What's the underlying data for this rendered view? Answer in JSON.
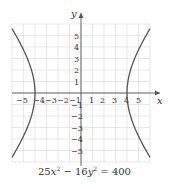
{
  "chart_data": {
    "type": "line",
    "equation": {
      "a": 25,
      "b": 16,
      "c": 400
    },
    "xlabel": "x",
    "ylabel": "y",
    "xlim": [
      -6,
      6
    ],
    "ylim": [
      -6,
      6
    ],
    "grid": true,
    "x_ticks": [
      -5,
      -4,
      -3,
      -2,
      -1,
      1,
      2,
      3,
      4,
      5
    ],
    "y_ticks": [
      5,
      4,
      3,
      2,
      1,
      -1,
      -2,
      -3,
      -4,
      -5
    ],
    "vertices": [
      [
        -4,
        0
      ],
      [
        4,
        0
      ]
    ],
    "series": [
      {
        "name": "right branch",
        "x": [
          6,
          5,
          4.5,
          4.2,
          4,
          4.2,
          4.5,
          5,
          6
        ],
        "y": [
          5.59,
          3.75,
          2.58,
          1.61,
          0,
          -1.61,
          -2.58,
          -3.75,
          -5.59
        ]
      },
      {
        "name": "left branch",
        "x": [
          -6,
          -5,
          -4.5,
          -4.2,
          -4,
          -4.2,
          -4.5,
          -5,
          -6
        ],
        "y": [
          5.59,
          3.75,
          2.58,
          1.61,
          0,
          -1.61,
          -2.58,
          -3.75,
          -5.59
        ]
      }
    ]
  },
  "labels": {
    "x_axis": "x",
    "y_axis": "y",
    "equation_prefix": "25",
    "equation_var1": "x",
    "equation_exp1": "2",
    "equation_mid": " − 16",
    "equation_var2": "y",
    "equation_exp2": "2",
    "equation_rhs": " = 400"
  },
  "colors": {
    "grid": "#d9d9d9",
    "axis": "#555555",
    "curve": "#555555"
  }
}
